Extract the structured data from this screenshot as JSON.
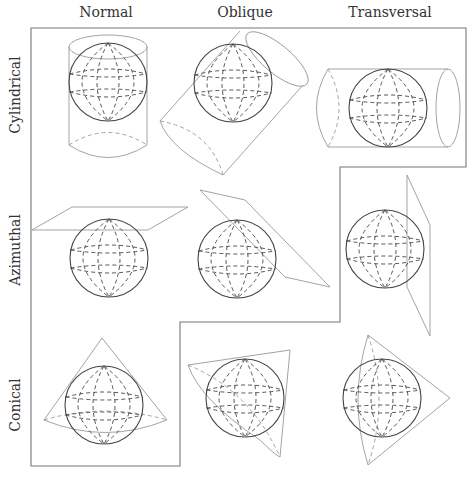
{
  "columns": [
    {
      "label": "Normal",
      "x": 106
    },
    {
      "label": "Oblique",
      "x": 245
    },
    {
      "label": "Transversal",
      "x": 390
    }
  ],
  "rows": [
    {
      "label": "Cylindrical",
      "y": 95
    },
    {
      "label": "Azimuthal",
      "y": 250
    },
    {
      "label": "Conical",
      "y": 405
    }
  ],
  "cells": [
    {
      "row": "Cylindrical",
      "column": "Normal",
      "surface": "cylinder",
      "orientation": "vertical"
    },
    {
      "row": "Cylindrical",
      "column": "Oblique",
      "surface": "cylinder",
      "orientation": "tilted"
    },
    {
      "row": "Cylindrical",
      "column": "Transversal",
      "surface": "cylinder",
      "orientation": "horizontal"
    },
    {
      "row": "Azimuthal",
      "column": "Normal",
      "surface": "plane",
      "orientation": "tangent-top"
    },
    {
      "row": "Azimuthal",
      "column": "Oblique",
      "surface": "plane",
      "orientation": "tangent-oblique"
    },
    {
      "row": "Azimuthal",
      "column": "Transversal",
      "surface": "plane",
      "orientation": "tangent-side"
    },
    {
      "row": "Conical",
      "column": "Normal",
      "surface": "cone",
      "orientation": "apex-up"
    },
    {
      "row": "Conical",
      "column": "Oblique",
      "surface": "cone",
      "orientation": "apex-oblique"
    },
    {
      "row": "Conical",
      "column": "Transversal",
      "surface": "cone",
      "orientation": "apex-right"
    }
  ],
  "colors": {
    "outline": "#777777",
    "surface": "#999999",
    "sphere": "#444444",
    "text": "#333333"
  }
}
